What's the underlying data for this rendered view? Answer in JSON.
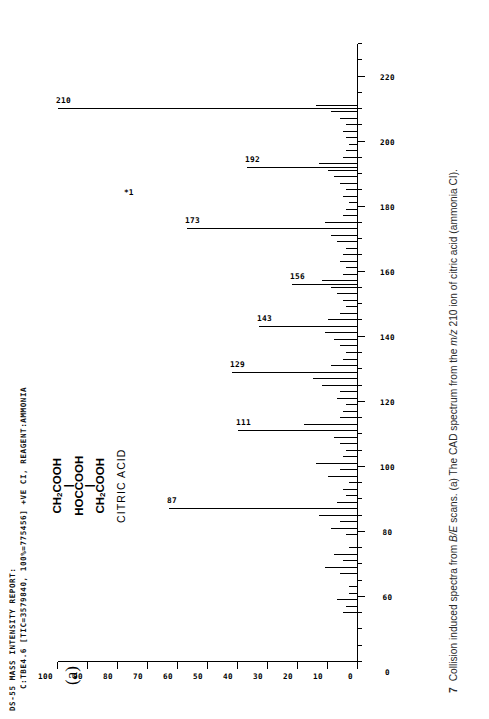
{
  "report": {
    "line1": "DS-55 MASS INTENSITY REPORT:",
    "line2": "C:TBE4.6 [TIC=3579840, 100%=775456] +VE CI, REAGENT:AMMONIA"
  },
  "panel": {
    "letter": "(a)"
  },
  "structure": {
    "top": "CH",
    "top_sub": "2",
    "top_rest": "COOH",
    "bond": "|",
    "middle": "HOCCOOH",
    "bottom": "CH",
    "bottom_sub": "2",
    "bottom_rest": "COOH",
    "name": "CITRIC ACID"
  },
  "annotation": {
    "star": "*1"
  },
  "caption": {
    "figure_number": "7",
    "text_pre": "Collision induced spectra from ",
    "text_italic": "B/E",
    "text_mid": " scans. (a) The CAD spectrum from the ",
    "text_italic2": "m/z",
    "text_post": " 210 ion of citric acid (ammonia CI)."
  },
  "chart_data": {
    "type": "bar",
    "xlabel": "m/z",
    "ylabel": "Relative intensity (%)",
    "xlim": [
      40,
      230
    ],
    "ylim": [
      0,
      100
    ],
    "grid": false,
    "legend": null,
    "xticks": [
      0,
      60,
      80,
      100,
      120,
      140,
      160,
      180,
      200,
      220
    ],
    "xtick_labels": [
      "0",
      "60",
      "80",
      "100",
      "120",
      "140",
      "160",
      "180",
      "200",
      "220"
    ],
    "yticks": [
      0,
      10,
      20,
      30,
      40,
      50,
      60,
      70,
      80,
      90,
      100
    ],
    "ytick_labels": [
      "0",
      "10",
      "20",
      "30",
      "40",
      "50",
      "60",
      "70",
      "80",
      "90",
      "100"
    ],
    "labelled_peaks": [
      {
        "mz": 210,
        "intensity": 100,
        "label": "210"
      },
      {
        "mz": 192,
        "intensity": 37,
        "label": "192"
      },
      {
        "mz": 173,
        "intensity": 57,
        "label": "173"
      },
      {
        "mz": 156,
        "intensity": 22,
        "label": "156"
      },
      {
        "mz": 143,
        "intensity": 33,
        "label": "143"
      },
      {
        "mz": 129,
        "intensity": 42,
        "label": "129"
      },
      {
        "mz": 111,
        "intensity": 40,
        "label": "111"
      },
      {
        "mz": 87,
        "intensity": 63,
        "label": "87"
      }
    ],
    "peaks": [
      {
        "mz": 55,
        "intensity": 5
      },
      {
        "mz": 57,
        "intensity": 4
      },
      {
        "mz": 59,
        "intensity": 7
      },
      {
        "mz": 61,
        "intensity": 3
      },
      {
        "mz": 63,
        "intensity": 3
      },
      {
        "mz": 67,
        "intensity": 6
      },
      {
        "mz": 69,
        "intensity": 11
      },
      {
        "mz": 71,
        "intensity": 5
      },
      {
        "mz": 73,
        "intensity": 8
      },
      {
        "mz": 75,
        "intensity": 3
      },
      {
        "mz": 79,
        "intensity": 4
      },
      {
        "mz": 81,
        "intensity": 9
      },
      {
        "mz": 83,
        "intensity": 6
      },
      {
        "mz": 85,
        "intensity": 13
      },
      {
        "mz": 87,
        "intensity": 63
      },
      {
        "mz": 89,
        "intensity": 7
      },
      {
        "mz": 91,
        "intensity": 4
      },
      {
        "mz": 93,
        "intensity": 5
      },
      {
        "mz": 95,
        "intensity": 3
      },
      {
        "mz": 97,
        "intensity": 10
      },
      {
        "mz": 99,
        "intensity": 6
      },
      {
        "mz": 101,
        "intensity": 14
      },
      {
        "mz": 103,
        "intensity": 5
      },
      {
        "mz": 105,
        "intensity": 4
      },
      {
        "mz": 107,
        "intensity": 6
      },
      {
        "mz": 109,
        "intensity": 8
      },
      {
        "mz": 111,
        "intensity": 40
      },
      {
        "mz": 113,
        "intensity": 18
      },
      {
        "mz": 115,
        "intensity": 6
      },
      {
        "mz": 117,
        "intensity": 5
      },
      {
        "mz": 119,
        "intensity": 4
      },
      {
        "mz": 121,
        "intensity": 7
      },
      {
        "mz": 123,
        "intensity": 6
      },
      {
        "mz": 125,
        "intensity": 12
      },
      {
        "mz": 127,
        "intensity": 15
      },
      {
        "mz": 129,
        "intensity": 42
      },
      {
        "mz": 131,
        "intensity": 9
      },
      {
        "mz": 133,
        "intensity": 5
      },
      {
        "mz": 135,
        "intensity": 4
      },
      {
        "mz": 137,
        "intensity": 6
      },
      {
        "mz": 139,
        "intensity": 8
      },
      {
        "mz": 141,
        "intensity": 11
      },
      {
        "mz": 143,
        "intensity": 33
      },
      {
        "mz": 145,
        "intensity": 10
      },
      {
        "mz": 147,
        "intensity": 6
      },
      {
        "mz": 149,
        "intensity": 4
      },
      {
        "mz": 151,
        "intensity": 5
      },
      {
        "mz": 153,
        "intensity": 7
      },
      {
        "mz": 155,
        "intensity": 9
      },
      {
        "mz": 156,
        "intensity": 22
      },
      {
        "mz": 157,
        "intensity": 12
      },
      {
        "mz": 159,
        "intensity": 5
      },
      {
        "mz": 161,
        "intensity": 4
      },
      {
        "mz": 163,
        "intensity": 6
      },
      {
        "mz": 165,
        "intensity": 5
      },
      {
        "mz": 167,
        "intensity": 4
      },
      {
        "mz": 169,
        "intensity": 7
      },
      {
        "mz": 171,
        "intensity": 9
      },
      {
        "mz": 173,
        "intensity": 57
      },
      {
        "mz": 175,
        "intensity": 11
      },
      {
        "mz": 177,
        "intensity": 5
      },
      {
        "mz": 179,
        "intensity": 4
      },
      {
        "mz": 181,
        "intensity": 3
      },
      {
        "mz": 183,
        "intensity": 5
      },
      {
        "mz": 185,
        "intensity": 4
      },
      {
        "mz": 187,
        "intensity": 6
      },
      {
        "mz": 189,
        "intensity": 8
      },
      {
        "mz": 191,
        "intensity": 10
      },
      {
        "mz": 192,
        "intensity": 37
      },
      {
        "mz": 193,
        "intensity": 13
      },
      {
        "mz": 195,
        "intensity": 5
      },
      {
        "mz": 197,
        "intensity": 4
      },
      {
        "mz": 199,
        "intensity": 3
      },
      {
        "mz": 201,
        "intensity": 4
      },
      {
        "mz": 203,
        "intensity": 5
      },
      {
        "mz": 205,
        "intensity": 4
      },
      {
        "mz": 207,
        "intensity": 6
      },
      {
        "mz": 209,
        "intensity": 9
      },
      {
        "mz": 210,
        "intensity": 100
      },
      {
        "mz": 211,
        "intensity": 14
      }
    ]
  }
}
